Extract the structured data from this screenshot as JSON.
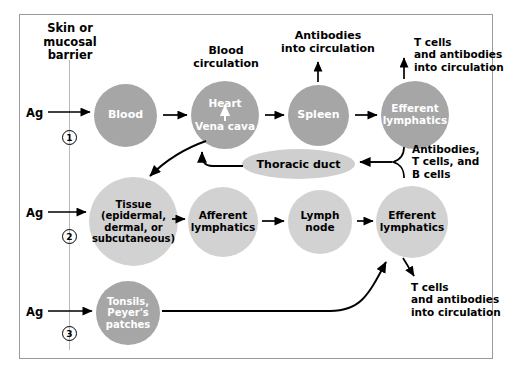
{
  "figure": {
    "barrier_label": "Skin or\nmucosal\nbarrier",
    "barrier_line_1": "Skin or",
    "barrier_line_2": "mucosal",
    "barrier_line_3": "barrier"
  },
  "colors": {
    "dark_node": "#a6a6a6",
    "light_node": "#d2d2d2",
    "ellipse": "#cfcfcf",
    "frame_border": "#9a9a9a",
    "divider": "#b9b9b9",
    "text_dark": "#000000",
    "text_light": "#ffffff"
  },
  "entries": [
    {
      "ag_label": "Ag",
      "number": "1"
    },
    {
      "ag_label": "Ag",
      "number": "2"
    },
    {
      "ag_label": "Ag",
      "number": "3"
    }
  ],
  "nodes": {
    "blood": {
      "label": "Blood",
      "style": "dark"
    },
    "heart": {
      "label_top": "Heart",
      "label_bottom": "Vena cava",
      "style": "dark",
      "caption": "Blood\ncirculation",
      "caption_line_1": "Blood",
      "caption_line_2": "circulation"
    },
    "spleen": {
      "label": "Spleen",
      "style": "dark"
    },
    "efferent_top": {
      "label_line_1": "Efferent",
      "label_line_2": "lymphatics",
      "style": "dark"
    },
    "thoracic_duct": {
      "label": "Thoracic duct",
      "style": "ellipse"
    },
    "tissue": {
      "label_line_1": "Tissue",
      "label_line_2": "(epidermal,",
      "label_line_3": "dermal, or",
      "label_line_4": "subcutaneous)",
      "style": "light"
    },
    "afferent": {
      "label_line_1": "Afferent",
      "label_line_2": "lymphatics",
      "style": "light"
    },
    "lymph_node": {
      "label_line_1": "Lymph",
      "label_line_2": "node",
      "style": "light"
    },
    "efferent_bottom": {
      "label_line_1": "Efferent",
      "label_line_2": "lymphatics",
      "style": "light"
    },
    "tonsils": {
      "label_line_1": "Tonsils,",
      "label_line_2": "Peyer's",
      "label_line_3": "patches",
      "style": "dark"
    }
  },
  "annotations": {
    "spleen_output": {
      "line_1": "Antibodies",
      "line_2": "into circulation"
    },
    "efferent_top_output": {
      "line_1": "T cells",
      "line_2": "and antibodies",
      "line_3": "into circulation"
    },
    "brace_output": {
      "line_1": "Antibodies,",
      "line_2": "T cells, and",
      "line_3": "B cells"
    },
    "efferent_bottom_output": {
      "line_1": "T cells",
      "line_2": "and antibodies",
      "line_3": "into circulation"
    }
  }
}
